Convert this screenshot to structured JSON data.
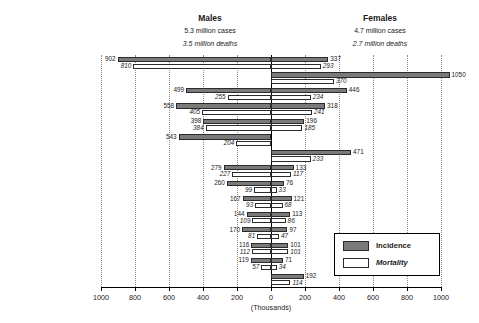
{
  "header": {
    "males": {
      "title": "Males",
      "cases": "5.3 million cases",
      "deaths": "3.5 million deaths"
    },
    "females": {
      "title": "Females",
      "cases": "4.7 million cases",
      "deaths": "2.7 million deaths"
    }
  },
  "legend": {
    "incidence_label": "Incidence",
    "mortality_label": "Mortality",
    "incidence_color": "#7a7a7a",
    "mortality_color": "#ffffff",
    "outline_color": "#2b2b2b"
  },
  "axis": {
    "title": "(Thousands)",
    "ticks": [
      "1000",
      "800",
      "600",
      "400",
      "200",
      "0",
      "200",
      "400",
      "600",
      "800",
      "1000"
    ],
    "max": 1000,
    "step": 200
  },
  "chart_data": {
    "type": "bar",
    "orientation": "horizontal-bidirectional",
    "title": "",
    "subtitle": "",
    "xlabel": "(Thousands)",
    "ylabel": "",
    "xlim": [
      -1000,
      1000
    ],
    "grid": true,
    "legend_position": "inside-bottom-right",
    "categories": [
      "Lung",
      "Breast",
      "Colon/Rectum",
      "Stomach",
      "Liver",
      "Prostate",
      "Cervix uteri",
      "Oesophagus",
      "Bladder",
      "Non-Hodgkin lymphoma",
      "Leukaemia",
      "Oral cavity",
      "Pancreas",
      "Kidney etc.",
      "Ovary etc."
    ],
    "series": [
      {
        "name": "Males Incidence",
        "side": "left",
        "style": "incidence",
        "values": [
          902,
          null,
          499,
          558,
          398,
          543,
          null,
          279,
          260,
          167,
          144,
          170,
          116,
          119,
          null
        ]
      },
      {
        "name": "Males Mortality",
        "side": "left",
        "style": "mortality",
        "values": [
          810,
          null,
          255,
          405,
          384,
          204,
          null,
          227,
          99,
          93,
          109,
          81,
          112,
          57,
          null
        ]
      },
      {
        "name": "Females Incidence",
        "side": "right",
        "style": "incidence",
        "values": [
          337,
          1050,
          446,
          318,
          196,
          null,
          471,
          133,
          76,
          121,
          113,
          97,
          101,
          71,
          192
        ]
      },
      {
        "name": "Females Mortality",
        "side": "right",
        "style": "mortality",
        "values": [
          293,
          370,
          234,
          241,
          185,
          null,
          233,
          117,
          33,
          68,
          86,
          47,
          101,
          34,
          114
        ]
      }
    ]
  }
}
